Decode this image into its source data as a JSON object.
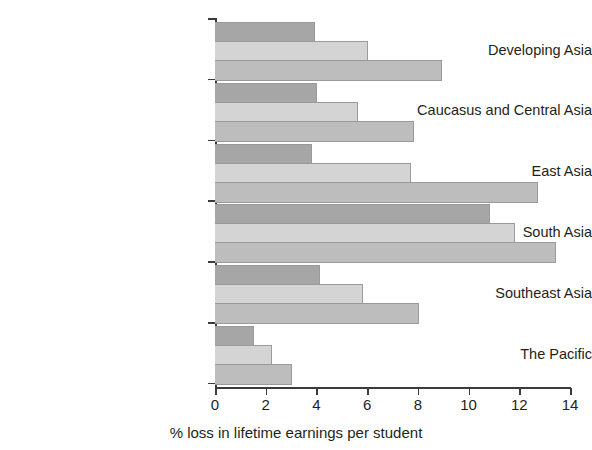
{
  "chart_data": {
    "type": "bar",
    "orientation": "horizontal",
    "title": "",
    "subtitle": "",
    "xlabel": "% loss in lifetime earnings per student",
    "ylabel": "",
    "xlim": [
      0,
      14
    ],
    "xticks": [
      0,
      2,
      4,
      6,
      8,
      10,
      12,
      14
    ],
    "xtick_labels": [
      "0",
      "2",
      "4",
      "6",
      "8",
      "10",
      "12",
      "14"
    ],
    "grid": false,
    "legend": "none",
    "categories": [
      "Developing Asia",
      "Caucasus and Central Asia",
      "East Asia",
      "South Asia",
      "Southeast Asia",
      "The Pacific"
    ],
    "series": [
      {
        "name": "series-1",
        "color": "#a6a6a6",
        "values": [
          3.9,
          4.0,
          3.8,
          10.8,
          4.1,
          1.5
        ]
      },
      {
        "name": "series-2",
        "color": "#d4d4d4",
        "values": [
          6.0,
          5.6,
          7.7,
          11.8,
          5.8,
          2.2
        ]
      },
      {
        "name": "series-3",
        "color": "#bdbdbd",
        "values": [
          8.9,
          7.8,
          12.7,
          13.4,
          8.0,
          3.0
        ]
      }
    ]
  },
  "axis": {
    "tick_color": "#3b3b3b",
    "bar_edge_color": "#9a9a9a"
  }
}
